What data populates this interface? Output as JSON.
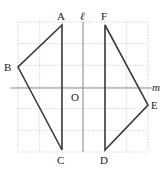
{
  "figure": {
    "kind": "geometry-diagram",
    "colors": {
      "grid": "#b9b9c4",
      "axis": "#8f8f8f",
      "shape": "#3a3a3a",
      "label": "#1a1a1a",
      "background": "#ffffff"
    },
    "grid": {
      "left": 18,
      "top": 22,
      "right": 148,
      "bottom": 152,
      "cell": 21.667,
      "cols": 6,
      "rows": 6,
      "style": "dotted"
    },
    "lines": [
      {
        "name": "l",
        "label": "ℓ",
        "orientation": "vertical",
        "x": 83,
        "y1": 22,
        "y2": 152
      },
      {
        "name": "m",
        "label": "m",
        "orientation": "horizontal",
        "y": 88,
        "x1": 10,
        "x2": 152
      }
    ],
    "points": [
      {
        "name": "A",
        "label": "A",
        "x": 62,
        "y": 25
      },
      {
        "name": "B",
        "label": "B",
        "x": 18,
        "y": 67
      },
      {
        "name": "C",
        "label": "C",
        "x": 62,
        "y": 150
      },
      {
        "name": "D",
        "label": "D",
        "x": 105,
        "y": 150
      },
      {
        "name": "E",
        "label": "E",
        "x": 148,
        "y": 105
      },
      {
        "name": "F",
        "label": "F",
        "x": 105,
        "y": 25
      },
      {
        "name": "O",
        "label": "O",
        "x": 83,
        "y": 88
      }
    ],
    "polygons": [
      {
        "name": "triangle-ABC",
        "vertices": "A,B,C",
        "points": "62,25 18,67 62,150"
      },
      {
        "name": "triangle-FED",
        "vertices": "F,E,D",
        "points": "105,25 148,105 105,150"
      }
    ],
    "labels": [
      {
        "name": "label-A",
        "text": "A",
        "x": 57,
        "y": 11,
        "italic": false
      },
      {
        "name": "label-l",
        "text": "ℓ",
        "x": 80,
        "y": 11,
        "italic": true
      },
      {
        "name": "label-F",
        "text": "F",
        "x": 101,
        "y": 11,
        "italic": false
      },
      {
        "name": "label-B",
        "text": "B",
        "x": 4,
        "y": 62,
        "italic": false
      },
      {
        "name": "label-m",
        "text": "m",
        "x": 152,
        "y": 82,
        "italic": true
      },
      {
        "name": "label-E",
        "text": "E",
        "x": 151,
        "y": 100,
        "italic": false
      },
      {
        "name": "label-O",
        "text": "O",
        "x": 71,
        "y": 92,
        "italic": false
      },
      {
        "name": "label-C",
        "text": "C",
        "x": 57,
        "y": 155,
        "italic": false
      },
      {
        "name": "label-D",
        "text": "D",
        "x": 100,
        "y": 155,
        "italic": false
      }
    ]
  }
}
